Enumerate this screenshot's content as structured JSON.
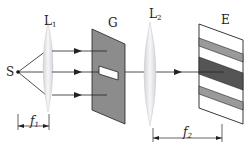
{
  "diagram": {
    "title": "",
    "labels": {
      "source": "S",
      "lens1": {
        "main": "L",
        "sub": "1"
      },
      "grating": "G",
      "lens2": {
        "main": "L",
        "sub": "2"
      },
      "screen": "E",
      "focal1": {
        "main": "f",
        "sub": "1"
      },
      "focal2": {
        "main": "f",
        "sub": "2"
      }
    },
    "colors": {
      "line": "#222222",
      "plate": "#8c8c8c",
      "slit": "#ffffff",
      "lens": "#e6e6ea",
      "band_light": "#9a9a9a",
      "band_dark": "#555555",
      "screen_bg": "#ffffff"
    },
    "components": [
      {
        "id": "S",
        "type": "point-source"
      },
      {
        "id": "L1",
        "type": "convex-lens"
      },
      {
        "id": "G",
        "type": "plate-with-slit"
      },
      {
        "id": "L2",
        "type": "convex-lens"
      },
      {
        "id": "E",
        "type": "screen-with-fringes",
        "bands": [
          "light-gray",
          "dark-gray",
          "light-gray"
        ]
      }
    ],
    "dimensions": [
      {
        "label": "f1",
        "from": "S",
        "to": "L1"
      },
      {
        "label": "f2",
        "from": "L2",
        "to": "E"
      }
    ]
  }
}
